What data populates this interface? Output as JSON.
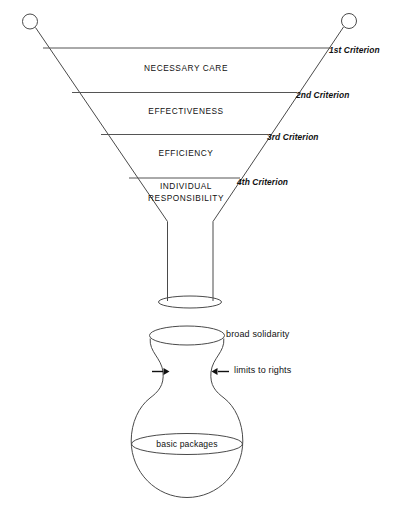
{
  "figure": {
    "colors": {
      "line": "#4a4a4a",
      "text": "#111111",
      "background": "#ffffff"
    }
  },
  "funnel": {
    "tiers": [
      {
        "label": "NECESSARY CARE",
        "x": 186,
        "y": 68
      },
      {
        "label": "EFFECTIVENESS",
        "x": 186,
        "y": 111
      },
      {
        "label": "EFFICIENCY",
        "x": 186,
        "y": 153
      },
      {
        "label": "INDIVIDUAL",
        "x": 186,
        "y": 186
      },
      {
        "label": "RESPONSIBILITY",
        "x": 186,
        "y": 198
      }
    ],
    "criteria": [
      {
        "label": "1st Criterion",
        "x": 329,
        "y": 45
      },
      {
        "label": "2nd Criterion",
        "x": 296,
        "y": 90
      },
      {
        "label": "3rd Criterion",
        "x": 267,
        "y": 132
      },
      {
        "label": "4th Criterion",
        "x": 237,
        "y": 177
      }
    ]
  },
  "flask": {
    "annotations": [
      {
        "name": "broad-solidarity",
        "label": "broad solidarity",
        "x": 226,
        "y": 332
      },
      {
        "name": "limits-to-rights",
        "label": "limits to rights",
        "x": 234,
        "y": 369
      }
    ],
    "fill_label": {
      "name": "basic-packages",
      "label": "basic packages",
      "x": 187,
      "y": 444
    }
  }
}
